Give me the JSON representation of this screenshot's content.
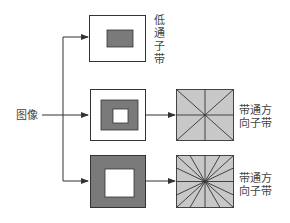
{
  "input": {
    "label": "图像"
  },
  "branches": [
    {
      "label": "低通子带",
      "type": "lowpass"
    },
    {
      "label_line1": "带通方",
      "label_line2": "向子带",
      "type": "bandpass",
      "directions": 4
    },
    {
      "label_line1": "带通方",
      "label_line2": "向子带",
      "type": "bandpass",
      "directions": 8
    }
  ],
  "colors": {
    "line": "#333333",
    "dark": "#7a7a7a",
    "light": "#c8c8c8",
    "white": "#ffffff"
  }
}
